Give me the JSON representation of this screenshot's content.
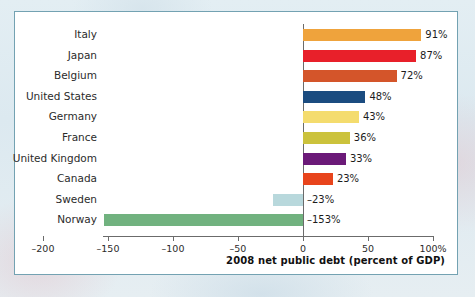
{
  "chart_data": {
    "type": "bar",
    "orientation": "horizontal",
    "title": "",
    "xlabel": "2008 net public debt (percent of GDP)",
    "ylabel": "",
    "xlim": [
      -200,
      100
    ],
    "xticks": [
      -200,
      -150,
      -100,
      -50,
      0,
      50,
      100
    ],
    "xtick_labels": [
      "–200",
      "–150",
      "–100",
      "–50",
      "0",
      "50",
      "100%"
    ],
    "grid": false,
    "legend": "none",
    "categories": [
      "Italy",
      "Japan",
      "Belgium",
      "United States",
      "Germany",
      "France",
      "United Kingdom",
      "Canada",
      "Sweden",
      "Norway"
    ],
    "values": [
      91,
      87,
      72,
      48,
      43,
      36,
      33,
      23,
      -23,
      -153
    ],
    "value_labels": [
      "91%",
      "87%",
      "72%",
      "48%",
      "43%",
      "36%",
      "33%",
      "23%",
      "–23%",
      "–153%"
    ],
    "colors": [
      "#efa33c",
      "#e8202a",
      "#d4552a",
      "#1b4c80",
      "#f4dc6e",
      "#cbc23c",
      "#6b1a78",
      "#e8441c",
      "#b8d8dc",
      "#71b27f"
    ],
    "bars": [
      {
        "label": "Italy",
        "value": 91,
        "value_label": "91%",
        "color": "#efa33c"
      },
      {
        "label": "Japan",
        "value": 87,
        "value_label": "87%",
        "color": "#e8202a"
      },
      {
        "label": "Belgium",
        "value": 72,
        "value_label": "72%",
        "color": "#d4552a"
      },
      {
        "label": "United States",
        "value": 48,
        "value_label": "48%",
        "color": "#1b4c80"
      },
      {
        "label": "Germany",
        "value": 43,
        "value_label": "43%",
        "color": "#f4dc6e"
      },
      {
        "label": "France",
        "value": 36,
        "value_label": "36%",
        "color": "#cbc23c"
      },
      {
        "label": "United Kingdom",
        "value": 33,
        "value_label": "33%",
        "color": "#6b1a78"
      },
      {
        "label": "Canada",
        "value": 23,
        "value_label": "23%",
        "color": "#e8441c"
      },
      {
        "label": "Sweden",
        "value": -23,
        "value_label": "–23%",
        "color": "#b8d8dc"
      },
      {
        "label": "Norway",
        "value": -153,
        "value_label": "–153%",
        "color": "#71b27f"
      }
    ]
  },
  "figure": {
    "frame_color": "#73a2b2",
    "axis_color": "#6b6b6b",
    "plot_background": "#ffffff"
  }
}
